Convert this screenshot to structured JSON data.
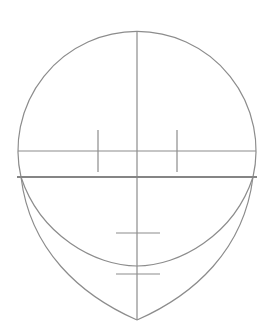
{
  "diagram": {
    "stroke_color": "#8c8c8c",
    "background": "#ffffff",
    "head_circle": {
      "cx": 137,
      "cy": 151,
      "r": 119
    },
    "center_line": {
      "x": 137,
      "y1": 32,
      "y2": 320
    },
    "eye_line": {
      "y": 151,
      "x1": 18,
      "x2": 256
    },
    "brow_line": {
      "y": 177,
      "x1": 17,
      "x2": 257
    },
    "eye_ticks": [
      {
        "x": 98,
        "y1": 130,
        "y2": 172
      },
      {
        "x": 177,
        "y1": 130,
        "y2": 172
      }
    ],
    "nose_tick": {
      "y": 233,
      "x1": 116,
      "x2": 160
    },
    "mouth_tick": {
      "y": 274,
      "x1": 116,
      "x2": 160
    },
    "inner_arc_bottom_y": 266,
    "chin_point": {
      "x": 137,
      "y": 320
    }
  }
}
